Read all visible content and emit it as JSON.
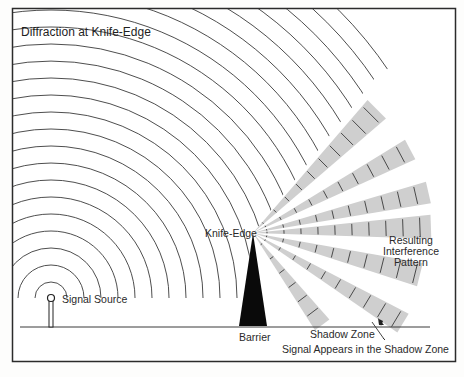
{
  "title": "Diffraction at Knife-Edge",
  "labels": {
    "signal_source": "Signal Source",
    "knife_edge": "Knife-Edge",
    "barrier": "Barrier",
    "shadow_zone": "Shadow Zone",
    "resulting_line1": "Resulting",
    "resulting_line2": "Interference",
    "resulting_line3": "Pattern",
    "signal_appears": "Signal Appears in the Shadow Zone"
  },
  "geometry": {
    "source": {
      "x": 51,
      "y": 298
    },
    "knife_edge": {
      "x": 253,
      "y": 233
    },
    "ground_y": 327,
    "arc_spacing": 17,
    "arc_count": 24,
    "ray_angles_deg": [
      -45,
      -28,
      -13,
      -2,
      14,
      31,
      53
    ]
  },
  "colors": {
    "line": "#3a3a3a",
    "wedge": "#cfcfcf",
    "barrier": "#0a0a0a",
    "frame": "#2b2b2b"
  }
}
